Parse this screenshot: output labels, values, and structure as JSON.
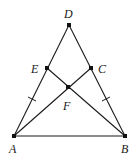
{
  "diagram": {
    "type": "geometry",
    "colors": {
      "line": "#1a1a1a",
      "point": "#111111",
      "background": "#ffffff"
    },
    "points": {
      "A": {
        "label": "A",
        "x": 14,
        "y": 136
      },
      "B": {
        "label": "B",
        "x": 125,
        "y": 136
      },
      "C": {
        "label": "C",
        "x": 91,
        "y": 68
      },
      "D": {
        "label": "D",
        "x": 69,
        "y": 25
      },
      "E": {
        "label": "E",
        "x": 47,
        "y": 68
      },
      "F": {
        "label": "F",
        "x": 68,
        "y": 87
      }
    },
    "segments": [
      "AB",
      "AD",
      "BD",
      "AC",
      "BE"
    ],
    "equal_marks": [
      "AE",
      "BC"
    ]
  }
}
